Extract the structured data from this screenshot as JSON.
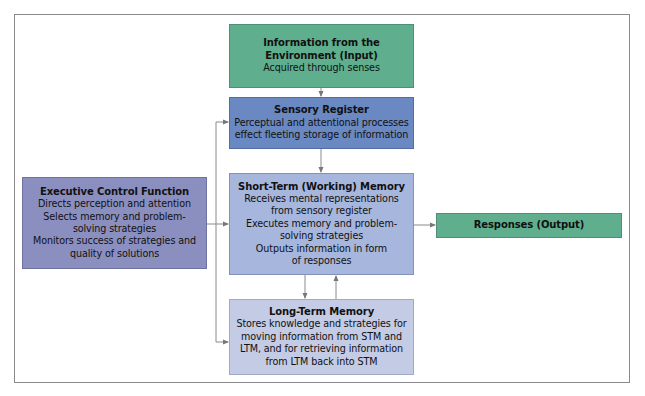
{
  "diagram": {
    "input": {
      "title_lines": [
        "Information from the",
        "Environment (Input)"
      ],
      "body_lines": [
        "Acquired through senses"
      ],
      "color": "#5fae8e"
    },
    "sensory_register": {
      "title": "Sensory Register",
      "body_lines": [
        "Perceptual and attentional processes",
        "effect fleeting storage of information"
      ],
      "color": "#6a88c2"
    },
    "short_term_memory": {
      "title": "Short-Term (Working) Memory",
      "body_lines": [
        "Receives mental representations",
        "from sensory register",
        "Executes memory and problem-",
        "solving strategies",
        "Outputs information in form",
        "of responses"
      ],
      "color": "#a7b6dd"
    },
    "long_term_memory": {
      "title": "Long-Term Memory",
      "body_lines": [
        "Stores knowledge and strategies for",
        "moving information from STM and",
        "LTM, and for retrieving information",
        "from LTM back into STM"
      ],
      "color": "#c3cbe5"
    },
    "executive_control": {
      "title": "Executive Control Function",
      "body_lines": [
        "Directs perception and attention",
        "Selects memory and problem-",
        "solving strategies",
        "Monitors success of strategies and",
        "quality of solutions"
      ],
      "color": "#8b8fbf"
    },
    "responses": {
      "title": "Responses (Output)",
      "color": "#5fae8e"
    },
    "connections": [
      {
        "from": "input",
        "to": "sensory_register"
      },
      {
        "from": "sensory_register",
        "to": "short_term_memory"
      },
      {
        "from": "short_term_memory",
        "to": "long_term_memory"
      },
      {
        "from": "long_term_memory",
        "to": "short_term_memory"
      },
      {
        "from": "short_term_memory",
        "to": "responses"
      },
      {
        "from": "executive_control",
        "to": "sensory_register"
      },
      {
        "from": "executive_control",
        "to": "short_term_memory"
      },
      {
        "from": "executive_control",
        "to": "long_term_memory"
      }
    ]
  }
}
